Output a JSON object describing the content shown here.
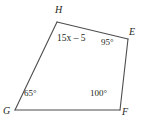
{
  "figure": {
    "name": "quadrilateral-EFGH",
    "shape_type": "quadrilateral",
    "stroke_color": "#4d4d4f",
    "text_color": "#231f20",
    "background_color": "#ffffff",
    "vertices": [
      {
        "id": "H",
        "label": "H",
        "x": 57,
        "y": 22
      },
      {
        "id": "E",
        "label": "E",
        "x": 128,
        "y": 39
      },
      {
        "id": "F",
        "label": "F",
        "x": 120,
        "y": 110
      },
      {
        "id": "G",
        "label": "G",
        "x": 15,
        "y": 110
      }
    ],
    "edges": [
      {
        "from": "H",
        "to": "E"
      },
      {
        "from": "E",
        "to": "F"
      },
      {
        "from": "F",
        "to": "G"
      },
      {
        "from": "G",
        "to": "H"
      }
    ],
    "angles": [
      {
        "at": "H",
        "label": "15x – 5",
        "kind": "expression"
      },
      {
        "at": "E",
        "label": "95°",
        "kind": "measure"
      },
      {
        "at": "F",
        "label": "100°",
        "kind": "measure"
      },
      {
        "at": "G",
        "label": "65°",
        "kind": "measure"
      }
    ]
  },
  "labels": {
    "vertex_H": "H",
    "vertex_E": "E",
    "vertex_F": "F",
    "vertex_G": "G",
    "angle_H_expression": "15x – 5",
    "angle_E": "95°",
    "angle_F": "100°",
    "angle_G": "65°"
  }
}
